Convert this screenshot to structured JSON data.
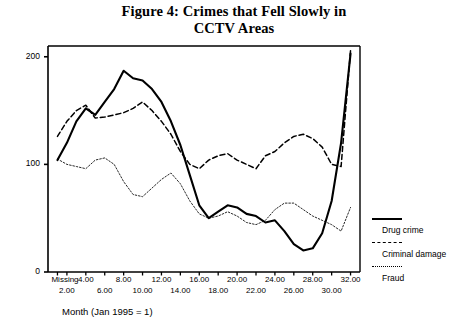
{
  "title": {
    "line1": "Figure 4: Crimes that Fell Slowly in",
    "line2": "CCTV Areas"
  },
  "axis": {
    "x_caption": "Month (Jan 1995 = 1)",
    "y_ticks": [
      "0",
      "100",
      "200"
    ],
    "x_ticks_row1": [
      "Missing",
      "4.00",
      "8.00",
      "12.00",
      "16.00",
      "20.00",
      "24.00",
      "28.00",
      "32.00"
    ],
    "x_ticks_row2": [
      "2.00",
      "6.00",
      "10.00",
      "14.00",
      "18.00",
      "22.00",
      "26.00",
      "30.00"
    ]
  },
  "legend": {
    "items": [
      {
        "label": "Drug crime",
        "style": "solid",
        "color": "#000000"
      },
      {
        "label": "Criminal damage",
        "style": "dashed",
        "color": "#000000"
      },
      {
        "label": "Fraud",
        "style": "dotted",
        "color": "#000000"
      }
    ]
  },
  "chart_data": {
    "type": "line",
    "title": "Figure 4: Crimes that Fell Slowly in CCTV Areas",
    "xlabel": "Month (Jan 1995 = 1)",
    "ylabel": "",
    "xlim": [
      0,
      33
    ],
    "ylim": [
      0,
      210
    ],
    "grid": false,
    "legend_position": "right",
    "x_tick_values": [
      1,
      2,
      4,
      6,
      8,
      10,
      12,
      14,
      16,
      18,
      20,
      22,
      24,
      26,
      28,
      30,
      32
    ],
    "y_tick_values": [
      0,
      100,
      200
    ],
    "x_first_tick_label": "Missing",
    "x": [
      1,
      2,
      3,
      4,
      5,
      6,
      7,
      8,
      9,
      10,
      11,
      12,
      13,
      14,
      15,
      16,
      17,
      18,
      19,
      20,
      21,
      22,
      23,
      24,
      25,
      26,
      27,
      28,
      29,
      30,
      31,
      32
    ],
    "series": [
      {
        "name": "Drug crime",
        "style": "solid",
        "color": "#000000",
        "values": [
          104,
          120,
          140,
          152,
          146,
          158,
          170,
          187,
          180,
          178,
          170,
          158,
          140,
          118,
          90,
          62,
          50,
          56,
          62,
          60,
          54,
          52,
          46,
          48,
          38,
          26,
          20,
          22,
          36,
          66,
          120,
          203
        ]
      },
      {
        "name": "Criminal damage",
        "style": "dashed",
        "color": "#000000",
        "values": [
          126,
          140,
          150,
          155,
          143,
          144,
          146,
          148,
          152,
          158,
          150,
          140,
          128,
          112,
          100,
          96,
          104,
          108,
          110,
          104,
          100,
          96,
          108,
          112,
          120,
          126,
          128,
          124,
          116,
          100,
          98,
          206
        ]
      },
      {
        "name": "Fraud",
        "style": "dotted",
        "color": "#000000",
        "values": [
          105,
          100,
          98,
          96,
          104,
          106,
          100,
          84,
          72,
          70,
          78,
          86,
          92,
          82,
          66,
          54,
          50,
          52,
          56,
          52,
          46,
          44,
          48,
          58,
          64,
          64,
          58,
          52,
          48,
          44,
          38,
          60
        ]
      }
    ]
  }
}
